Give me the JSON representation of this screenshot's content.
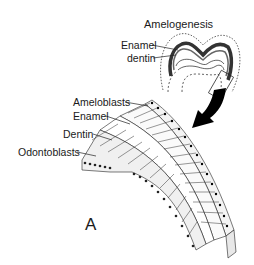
{
  "figure": {
    "panel_label": "A",
    "inset": {
      "title": "Amelogenesis",
      "labels": [
        "Enamel",
        "dentin"
      ]
    },
    "detail": {
      "labels": [
        "Ameloblasts",
        "Enamel",
        "Dentin",
        "Odontoblasts"
      ]
    },
    "colors": {
      "line": "#1a1a1a",
      "arrow": "#000000",
      "background": "#ffffff"
    }
  }
}
